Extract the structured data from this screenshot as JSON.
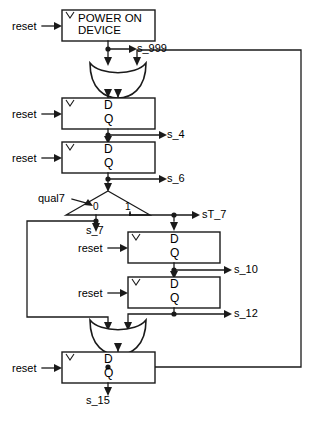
{
  "diagram": {
    "type": "digital-circuit-schematic",
    "canvas": {
      "width": 314,
      "height": 421,
      "background": "#ffffff"
    },
    "ink_color": "#1a1a1a"
  },
  "blocks": [
    {
      "id": "power_on_device",
      "kind": "process-block",
      "label_line1": "POWER ON",
      "label_line2": "DEVICE",
      "clock_marker": "V",
      "reset_label": "reset",
      "output_signal": "s_999",
      "rect": {
        "x": 62,
        "y": 10,
        "w": 93,
        "h": 31
      }
    },
    {
      "id": "ff_s4",
      "kind": "d-flip-flop",
      "d_label": "D",
      "q_label": "Q",
      "clock_marker": "V",
      "reset_label": "reset",
      "output_signal": "s_4",
      "rect": {
        "x": 62,
        "y": 98,
        "w": 93,
        "h": 31
      }
    },
    {
      "id": "ff_s6",
      "kind": "d-flip-flop",
      "d_label": "D",
      "q_label": "Q",
      "clock_marker": "V",
      "reset_label": "reset",
      "output_signal": "s_6",
      "rect": {
        "x": 62,
        "y": 142,
        "w": 93,
        "h": 31
      }
    },
    {
      "id": "ff_s10",
      "kind": "d-flip-flop",
      "d_label": "D",
      "q_label": "Q",
      "clock_marker": "V",
      "reset_label": "reset",
      "output_signal": "s_10",
      "rect": {
        "x": 128,
        "y": 232,
        "w": 92,
        "h": 31
      }
    },
    {
      "id": "ff_s12",
      "kind": "d-flip-flop",
      "d_label": "D",
      "q_label": "Q",
      "clock_marker": "V",
      "reset_label": "reset",
      "output_signal": "s_12",
      "rect": {
        "x": 128,
        "y": 277,
        "w": 92,
        "h": 31
      }
    },
    {
      "id": "ff_s15",
      "kind": "d-flip-flop",
      "d_label": "D",
      "q_label": "Q",
      "clock_marker": "V",
      "reset_label": "reset",
      "output_signal": "s_15",
      "rect": {
        "x": 62,
        "y": 352,
        "w": 93,
        "h": 31
      }
    }
  ],
  "gates": [
    {
      "id": "or_gate_top",
      "kind": "or-gate",
      "inputs": [
        "s_999",
        "s_15_feedback"
      ],
      "region": {
        "x": 90,
        "y": 60,
        "w": 56,
        "h": 33
      }
    },
    {
      "id": "or_gate_bottom",
      "kind": "or-gate",
      "inputs": [
        "s_7_feedback",
        "s_12"
      ],
      "region": {
        "x": 90,
        "y": 317,
        "w": 56,
        "h": 33
      }
    }
  ],
  "mux": {
    "id": "mux_qual7",
    "kind": "demultiplexer",
    "select_label": "qual7",
    "input_signal": "s_6",
    "port_0_label": "0",
    "port_1_label": "1",
    "output_0_signal": "s_7",
    "output_1_signal": "sT_7",
    "region": {
      "x": 85,
      "y": 190,
      "w": 80,
      "h": 25
    }
  },
  "signals": [
    {
      "name": "s_999",
      "x": 137,
      "y": 49
    },
    {
      "name": "s_4",
      "x": 167,
      "y": 135
    },
    {
      "name": "s_6",
      "x": 167,
      "y": 179
    },
    {
      "name": "s_7",
      "x": 104,
      "y": 229
    },
    {
      "name": "sT_7",
      "x": 200,
      "y": 215
    },
    {
      "name": "s_10",
      "x": 232,
      "y": 270
    },
    {
      "name": "s_12",
      "x": 232,
      "y": 314
    },
    {
      "name": "s_15",
      "x": 104,
      "y": 400
    }
  ],
  "inputs": [
    {
      "name": "reset",
      "target": "power_on_device",
      "x": 18,
      "y": 29
    },
    {
      "name": "reset",
      "target": "ff_s4",
      "x": 18,
      "y": 117
    },
    {
      "name": "reset",
      "target": "ff_s6",
      "x": 18,
      "y": 161
    },
    {
      "name": "reset",
      "target": "ff_s10",
      "x": 84,
      "y": 251
    },
    {
      "name": "reset",
      "target": "ff_s12",
      "x": 84,
      "y": 296
    },
    {
      "name": "reset",
      "target": "ff_s15",
      "x": 18,
      "y": 371
    },
    {
      "name": "qual7",
      "target": "mux_qual7",
      "x": 52,
      "y": 199
    }
  ],
  "feedback_paths": [
    {
      "id": "global-feedback",
      "from": "s_15",
      "to": "or_gate_top",
      "right_rail_x": 301
    },
    {
      "id": "local-feedback",
      "from": "s_7",
      "to": "or_gate_bottom",
      "left_rail_x": 27
    }
  ]
}
